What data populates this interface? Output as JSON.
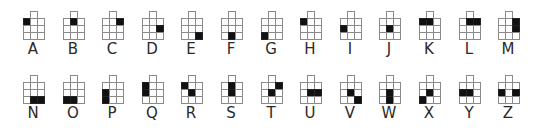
{
  "diagram": {
    "colors": {
      "filled": "#111111",
      "grid_line": "#8a8a8a",
      "text": "#2a2a2a",
      "background": "#ffffff"
    },
    "grid_description": "Each glyph is a 3x3 grid with an extra cell above the middle column; filled cells encode the letter. Coordinates are [row, col] within the 3x3 grid.",
    "rows": [
      {
        "letters": [
          {
            "letter": "A",
            "filled": [
              [
                0,
                0
              ]
            ]
          },
          {
            "letter": "B",
            "filled": [
              [
                0,
                1
              ]
            ]
          },
          {
            "letter": "C",
            "filled": [
              [
                0,
                2
              ]
            ]
          },
          {
            "letter": "D",
            "filled": [
              [
                1,
                2
              ]
            ]
          },
          {
            "letter": "E",
            "filled": [
              [
                2,
                2
              ]
            ]
          },
          {
            "letter": "F",
            "filled": [
              [
                2,
                1
              ]
            ]
          },
          {
            "letter": "G",
            "filled": [
              [
                2,
                0
              ]
            ]
          },
          {
            "letter": "H",
            "filled": [
              [
                0,
                0
              ]
            ]
          },
          {
            "letter": "I",
            "filled": [
              [
                1,
                0
              ]
            ]
          },
          {
            "letter": "J",
            "filled": [
              [
                1,
                1
              ]
            ]
          },
          {
            "letter": "K",
            "filled": [
              [
                0,
                0
              ],
              [
                0,
                1
              ]
            ]
          },
          {
            "letter": "L",
            "filled": [
              [
                0,
                1
              ],
              [
                0,
                2
              ]
            ]
          },
          {
            "letter": "M",
            "filled": [
              [
                0,
                2
              ],
              [
                1,
                2
              ]
            ]
          }
        ]
      },
      {
        "letters": [
          {
            "letter": "N",
            "filled": [
              [
                2,
                1
              ],
              [
                2,
                2
              ]
            ]
          },
          {
            "letter": "O",
            "filled": [
              [
                2,
                0
              ],
              [
                2,
                1
              ]
            ]
          },
          {
            "letter": "P",
            "filled": [
              [
                1,
                0
              ],
              [
                2,
                0
              ]
            ]
          },
          {
            "letter": "Q",
            "filled": [
              [
                0,
                0
              ],
              [
                1,
                0
              ]
            ]
          },
          {
            "letter": "R",
            "filled": [
              [
                0,
                0
              ],
              [
                1,
                1
              ]
            ]
          },
          {
            "letter": "S",
            "filled": [
              [
                0,
                1
              ],
              [
                1,
                1
              ]
            ]
          },
          {
            "letter": "T",
            "filled": [
              [
                0,
                2
              ],
              [
                1,
                1
              ]
            ]
          },
          {
            "letter": "U",
            "filled": [
              [
                1,
                1
              ],
              [
                1,
                2
              ]
            ]
          },
          {
            "letter": "V",
            "filled": [
              [
                1,
                1
              ],
              [
                2,
                2
              ]
            ]
          },
          {
            "letter": "W",
            "filled": [
              [
                1,
                1
              ],
              [
                2,
                1
              ]
            ]
          },
          {
            "letter": "X",
            "filled": [
              [
                1,
                1
              ],
              [
                2,
                0
              ]
            ]
          },
          {
            "letter": "Y",
            "filled": [
              [
                1,
                0
              ],
              [
                1,
                1
              ]
            ]
          },
          {
            "letter": "Z",
            "filled": [
              [
                1,
                0
              ],
              [
                1,
                2
              ]
            ]
          }
        ]
      }
    ]
  }
}
